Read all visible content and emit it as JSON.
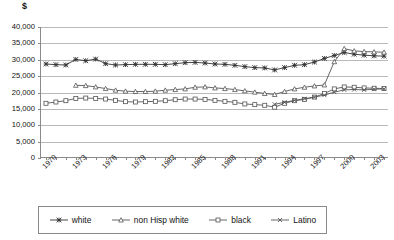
{
  "axis": {
    "unit_label": "$",
    "y_ticks": [
      "40,000",
      "35,000",
      "30,000",
      "25,000",
      "20,000",
      "15,000",
      "10,000",
      "5,000",
      "0"
    ],
    "x_labels": [
      "1970",
      "1973",
      "1976",
      "1979",
      "1982",
      "1985",
      "1988",
      "1991",
      "1994",
      "1997",
      "2000",
      "2003"
    ]
  },
  "legend": {
    "items": [
      {
        "label": "white",
        "marker": "asterisk-marker",
        "color": "#333333"
      },
      {
        "label": "non Hisp white",
        "marker": "triangle-marker",
        "color": "#555555"
      },
      {
        "label": "black",
        "marker": "square-marker",
        "color": "#555555"
      },
      {
        "label": "Latino",
        "marker": "x-marker",
        "color": "#555555"
      }
    ]
  },
  "chart_data": {
    "type": "line",
    "title": "",
    "subtitle": "",
    "xlabel": "",
    "ylabel": "$",
    "ylim": [
      0,
      40000
    ],
    "ytick_step": 5000,
    "grid": true,
    "legend_position": "bottom",
    "x": [
      1970,
      1971,
      1972,
      1973,
      1974,
      1975,
      1976,
      1977,
      1978,
      1979,
      1980,
      1981,
      1982,
      1983,
      1984,
      1985,
      1986,
      1987,
      1988,
      1989,
      1990,
      1991,
      1992,
      1993,
      1994,
      1995,
      1996,
      1997,
      1998,
      1999,
      2000,
      2001,
      2002,
      2003,
      2004
    ],
    "series": [
      {
        "name": "white",
        "marker": "asterisk-marker",
        "color": "#333333",
        "values": [
          28700,
          28500,
          28400,
          30100,
          29700,
          30200,
          28800,
          28400,
          28500,
          28600,
          28600,
          28600,
          28500,
          28800,
          29100,
          29200,
          29000,
          28700,
          28600,
          28300,
          27900,
          27600,
          27500,
          26900,
          27600,
          28300,
          28500,
          29300,
          30400,
          31300,
          32200,
          31700,
          31400,
          31200,
          31100
        ]
      },
      {
        "name": "non Hisp white",
        "marker": "triangle-marker",
        "color": "#555555",
        "values": [
          null,
          null,
          null,
          22200,
          22100,
          21700,
          21200,
          20700,
          20400,
          20300,
          20300,
          20400,
          20700,
          20900,
          21100,
          21600,
          21700,
          21400,
          21200,
          20900,
          20500,
          20100,
          19700,
          19400,
          20300,
          21100,
          21600,
          22000,
          22300,
          29400,
          33400,
          32700,
          32500,
          32400,
          32300
        ]
      },
      {
        "name": "black",
        "marker": "square-marker",
        "color": "#555555",
        "values": [
          16700,
          17100,
          17500,
          18200,
          18300,
          18200,
          18000,
          17600,
          17200,
          17100,
          17200,
          17300,
          17500,
          17800,
          18000,
          18000,
          17900,
          17600,
          17300,
          17000,
          16500,
          16300,
          16100,
          15500,
          16700,
          17500,
          17900,
          18600,
          19700,
          21100,
          21700,
          21600,
          21400,
          21300,
          21200
        ]
      },
      {
        "name": "Latino",
        "marker": "x-marker",
        "color": "#555555",
        "values": [
          null,
          null,
          null,
          null,
          null,
          null,
          null,
          null,
          null,
          null,
          null,
          null,
          null,
          null,
          null,
          null,
          null,
          null,
          null,
          null,
          null,
          null,
          null,
          16400,
          17000,
          17600,
          18100,
          18600,
          19200,
          20100,
          20800,
          20900,
          20800,
          21000,
          21100
        ]
      }
    ]
  }
}
